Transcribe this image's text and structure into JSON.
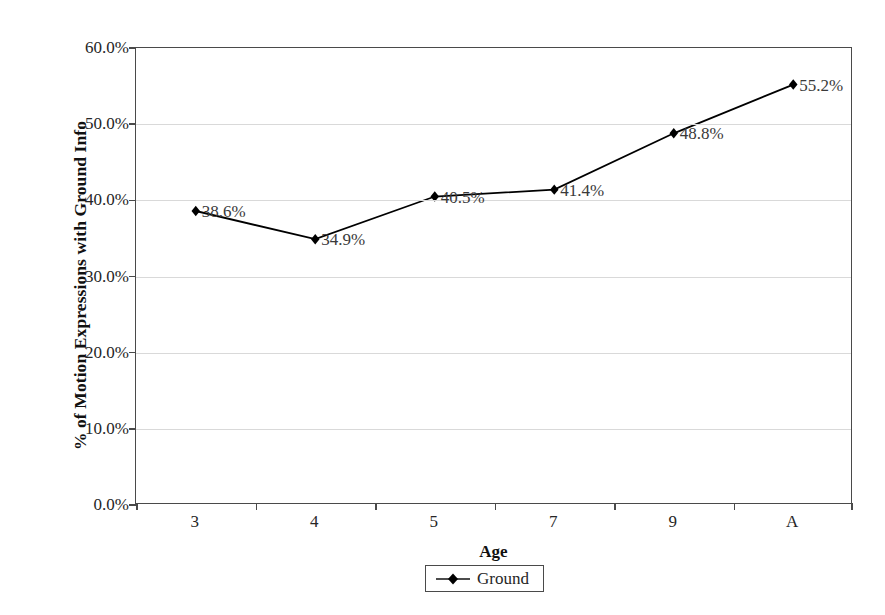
{
  "chart_data": {
    "type": "line",
    "title": "",
    "xlabel": "Age",
    "ylabel": "% of Motion Expressions with Ground Info",
    "categories": [
      "3",
      "4",
      "5",
      "7",
      "9",
      "A"
    ],
    "series": [
      {
        "name": "Ground",
        "values": [
          38.6,
          34.9,
          40.5,
          41.4,
          48.8,
          55.2
        ],
        "labels": [
          "38.6%",
          "34.9%",
          "40.5%",
          "41.4%",
          "48.8%",
          "55.2%"
        ],
        "marker": "diamond",
        "color": "#000000"
      }
    ],
    "ylim": [
      0,
      60
    ],
    "ytick_values": [
      0,
      10,
      20,
      30,
      40,
      50,
      60
    ],
    "ytick_labels": [
      "0.0%",
      "10.0%",
      "20.0%",
      "30.0%",
      "40.0%",
      "50.0%",
      "60.0%"
    ],
    "grid": "horizontal",
    "legend_position": "bottom-center",
    "gridline_color": "#d9d9d9",
    "axis_color": "#4a4a4a",
    "plot_background": "#ffffff"
  },
  "legend": {
    "entries": [
      {
        "label": "Ground"
      }
    ]
  }
}
